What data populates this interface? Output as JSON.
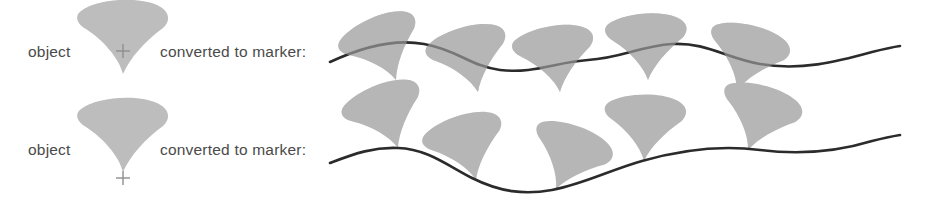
{
  "figure": {
    "background_color": "#ffffff",
    "marker_fill_color": "#b6b6b6",
    "curve_stroke_color": "#2b2b2b",
    "text_color": "#4a4a4a"
  },
  "rows": [
    {
      "id": "row-center-reference",
      "object_label": "object",
      "converted_label": "converted to marker:",
      "reference_point": "center",
      "object_icon": "cone-marker-center-reference",
      "object_cx": 123,
      "object_cy": 50,
      "cross_x": 123,
      "cross_y": 51,
      "label_object_x": 28,
      "label_object_y": 57,
      "label_converted_x": 160,
      "label_converted_y": 57,
      "curve": "M 330 62 C 360 48 392 38 424 44 C 458 50 470 66 500 70 C 534 74 556 62 588 60 C 622 58 640 46 672 44 C 706 42 726 58 760 64 C 800 71 836 62 872 52 C 884 49 893 47 900 46",
      "markers": [
        {
          "x": 396,
          "y": 52,
          "rotation": -22
        },
        {
          "x": 478,
          "y": 63,
          "rotation": -14
        },
        {
          "x": 560,
          "y": 63,
          "rotation": -8
        },
        {
          "x": 648,
          "y": 50,
          "rotation": -2
        },
        {
          "x": 737,
          "y": 60,
          "rotation": 16
        }
      ]
    },
    {
      "id": "row-tip-reference",
      "object_label": "object",
      "converted_label": "converted to marker:",
      "reference_point": "tip",
      "object_icon": "cone-marker-tip-reference",
      "object_cx": 123,
      "object_cy": 140,
      "cross_x": 123,
      "cross_y": 178,
      "label_object_x": 28,
      "label_object_y": 155,
      "label_converted_x": 160,
      "label_converted_y": 155,
      "curve": "M 330 163 C 356 153 374 147 398 148 C 428 149 448 166 472 178 C 500 192 524 195 552 190 C 584 184 610 170 642 161 C 684 149 722 145 760 150 C 800 155 836 152 872 141 C 884 138 894 136 900 135",
      "markers": [
        {
          "x": 398,
          "y": 148,
          "rotation": -20
        },
        {
          "x": 476,
          "y": 180,
          "rotation": -16
        },
        {
          "x": 556,
          "y": 189,
          "rotation": 22
        },
        {
          "x": 644,
          "y": 161,
          "rotation": 2
        },
        {
          "x": 748,
          "y": 150,
          "rotation": 18
        }
      ]
    }
  ]
}
